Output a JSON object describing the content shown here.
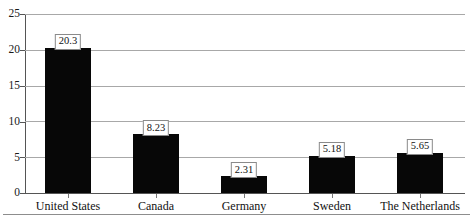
{
  "chart_data": {
    "type": "bar",
    "title": "",
    "subtitle": "",
    "xlabel": "",
    "ylabel": "",
    "categories": [
      "United States",
      "Canada",
      "Germany",
      "Sweden",
      "The Netherlands"
    ],
    "values": [
      20.3,
      8.23,
      2.31,
      5.18,
      5.65
    ],
    "value_labels": [
      "20.3",
      "8.23",
      "2.31",
      "5.18",
      "5.65"
    ],
    "ylim": [
      0,
      25
    ],
    "yticks": [
      0,
      5,
      10,
      15,
      20,
      25
    ],
    "ytick_labels": [
      "0",
      "5",
      "10",
      "15",
      "20",
      "25"
    ],
    "grid": true,
    "grid_axis": "y",
    "legend": false,
    "legend_position": "none",
    "bar_color": "#070707",
    "grid_color": "#a8a8a8",
    "axis_color": "#555555",
    "background_color": "#ffffff",
    "label_box_border_color": "#8a8a8a",
    "label_box_background": "#ffffff",
    "annotations": []
  }
}
